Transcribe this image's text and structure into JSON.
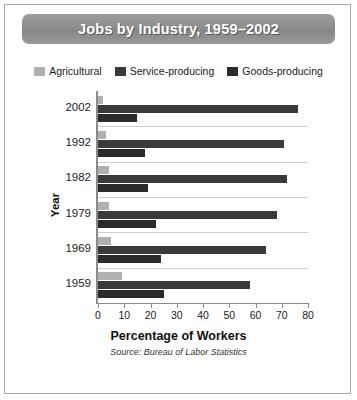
{
  "figure": {
    "title": "Jobs by Industry, 1959–2002",
    "x_axis_title": "Percentage of Workers",
    "y_axis_title": "Year",
    "source_note": "Source: Bureau of Labor Statistics"
  },
  "legend": {
    "items": [
      {
        "label": "Agricultural",
        "color": "#b0b0b0",
        "icon": "legend-swatch-icon"
      },
      {
        "label": "Service-producing",
        "color": "#3a3a3a",
        "icon": "legend-swatch-icon"
      },
      {
        "label": "Goods-producing",
        "color": "#2b2b2b",
        "icon": "legend-swatch-icon"
      }
    ]
  },
  "chart_data": {
    "type": "bar",
    "orientation": "horizontal",
    "title": "Jobs by Industry, 1959–2002",
    "xlabel": "Percentage of Workers",
    "ylabel": "Year",
    "xlim": [
      0,
      80
    ],
    "xticks": [
      0,
      10,
      20,
      30,
      40,
      50,
      60,
      70,
      80
    ],
    "grid": true,
    "legend_position": "top",
    "categories": [
      "2002",
      "1992",
      "1982",
      "1979",
      "1969",
      "1959"
    ],
    "series": [
      {
        "name": "Agricultural",
        "color": "#b0b0b0",
        "values": [
          2,
          3,
          4,
          4,
          5,
          9
        ]
      },
      {
        "name": "Service-producing",
        "color": "#3a3a3a",
        "values": [
          76,
          71,
          72,
          68,
          64,
          58
        ]
      },
      {
        "name": "Goods-producing",
        "color": "#2b2b2b",
        "values": [
          15,
          18,
          19,
          22,
          24,
          25
        ]
      }
    ],
    "source": "Source: Bureau of Labor Statistics"
  }
}
